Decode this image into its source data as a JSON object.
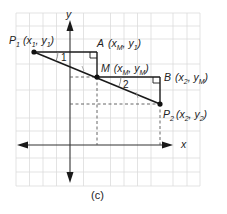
{
  "figure": {
    "caption": "(c)",
    "axes": {
      "x_label": "x",
      "y_label": "y"
    },
    "points": {
      "P1": {
        "name": "P",
        "sub": "1",
        "coords": "(x₁, y₁)",
        "coord_text_a": "(x",
        "coord_sub_a": "1",
        "coord_mid": ", y",
        "coord_sub_b": "1",
        "coord_end": ")"
      },
      "A": {
        "name": "A",
        "coord_text_a": "(x",
        "coord_sub_a": "M",
        "coord_mid": ", y",
        "coord_sub_b": "1",
        "coord_end": ")"
      },
      "M": {
        "name": "M",
        "coord_text_a": "(x",
        "coord_sub_a": "M",
        "coord_mid": ", y",
        "coord_sub_b": "M",
        "coord_end": ")"
      },
      "B": {
        "name": "B",
        "coord_text_a": "(x",
        "coord_sub_a": "2",
        "coord_mid": ", y",
        "coord_sub_b": "M",
        "coord_end": ")"
      },
      "P2": {
        "name": "P",
        "sub": "2",
        "coord_text_a": "(x",
        "coord_sub_a": "2",
        "coord_mid": ", y",
        "coord_sub_b": "2",
        "coord_end": ")"
      }
    },
    "angles": {
      "angle1": "1",
      "angle2": "2"
    },
    "colors": {
      "grid": "#dcdcdc",
      "line": "#1a1a1a",
      "dashed": "#555555"
    }
  }
}
